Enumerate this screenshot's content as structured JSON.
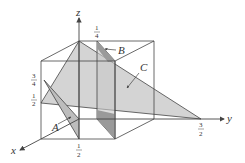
{
  "figure": {
    "type": "3d-coordinate-diagram",
    "colors": {
      "background": "#ffffff",
      "line": "#444444",
      "plane_light": "#d4d4d4",
      "plane_dark": "#9a9a9a"
    },
    "axes": {
      "x": {
        "label": "x"
      },
      "y": {
        "label": "y"
      },
      "z": {
        "label": "z"
      }
    },
    "tick_labels": {
      "x_half": {
        "num": "1",
        "den": "2"
      },
      "y_three_halves": {
        "num": "3",
        "den": "2"
      },
      "z_quarter_top": {
        "num": "1",
        "den": "4"
      },
      "z_three_quarters": {
        "num": "3",
        "den": "4"
      },
      "z_half": {
        "num": "1",
        "den": "2"
      }
    },
    "planes": {
      "A": {
        "label": "A"
      },
      "B": {
        "label": "B"
      },
      "C": {
        "label": "C"
      }
    }
  }
}
